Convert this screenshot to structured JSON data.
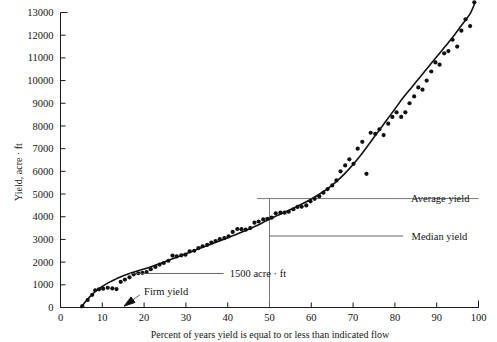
{
  "chart_data": {
    "type": "scatter",
    "title": "",
    "xlabel": "Percent of years yield is equal to or less than indicated flow",
    "ylabel": "Yield, acre · ft",
    "xlim": [
      0,
      100
    ],
    "ylim": [
      0,
      13000
    ],
    "grid": false,
    "legend": null,
    "xticks": [
      0,
      10,
      20,
      30,
      40,
      50,
      60,
      70,
      80,
      90,
      100
    ],
    "xtick_labels": [
      "0",
      "10",
      "20",
      "30",
      "40",
      "50",
      "60",
      "70",
      "80",
      "90",
      "100"
    ],
    "yticks": [
      0,
      1000,
      2000,
      3000,
      4000,
      5000,
      6000,
      7000,
      8000,
      9000,
      10000,
      11000,
      12000,
      13000
    ],
    "ytick_labels": [
      "0",
      "1000",
      "2000",
      "3000",
      "4000",
      "5000",
      "6000",
      "7000",
      "8000",
      "9000",
      "10000",
      "11000",
      "12000",
      "13000"
    ],
    "series": [
      {
        "name": "Observed yield",
        "marker": "dot",
        "points": [
          [
            5.2,
            60
          ],
          [
            6.5,
            330
          ],
          [
            7.6,
            560
          ],
          [
            8.3,
            760
          ],
          [
            9.2,
            800
          ],
          [
            10.2,
            830
          ],
          [
            11.3,
            870
          ],
          [
            12.4,
            840
          ],
          [
            13.4,
            810
          ],
          [
            14.4,
            1130
          ],
          [
            15.4,
            1230
          ],
          [
            16.5,
            1330
          ],
          [
            17.5,
            1460
          ],
          [
            18.6,
            1510
          ],
          [
            19.6,
            1530
          ],
          [
            20.6,
            1560
          ],
          [
            21.6,
            1690
          ],
          [
            22.7,
            1790
          ],
          [
            23.7,
            1890
          ],
          [
            24.7,
            1960
          ],
          [
            25.8,
            2060
          ],
          [
            26.8,
            2290
          ],
          [
            27.8,
            2250
          ],
          [
            28.9,
            2300
          ],
          [
            29.9,
            2330
          ],
          [
            30.9,
            2470
          ],
          [
            32.0,
            2500
          ],
          [
            33.0,
            2620
          ],
          [
            34.0,
            2700
          ],
          [
            35.1,
            2760
          ],
          [
            36.1,
            2860
          ],
          [
            37.1,
            2930
          ],
          [
            38.1,
            3010
          ],
          [
            39.2,
            3060
          ],
          [
            40.2,
            3130
          ],
          [
            41.2,
            3330
          ],
          [
            42.3,
            3460
          ],
          [
            43.3,
            3450
          ],
          [
            44.3,
            3430
          ],
          [
            45.4,
            3500
          ],
          [
            46.4,
            3740
          ],
          [
            47.4,
            3790
          ],
          [
            48.5,
            3880
          ],
          [
            49.5,
            3910
          ],
          [
            50.5,
            3960
          ],
          [
            51.5,
            4150
          ],
          [
            52.6,
            4180
          ],
          [
            53.6,
            4180
          ],
          [
            54.6,
            4220
          ],
          [
            55.7,
            4330
          ],
          [
            56.7,
            4430
          ],
          [
            57.7,
            4440
          ],
          [
            58.8,
            4500
          ],
          [
            59.8,
            4680
          ],
          [
            60.8,
            4790
          ],
          [
            61.9,
            4900
          ],
          [
            62.9,
            5060
          ],
          [
            63.9,
            5220
          ],
          [
            65.0,
            5380
          ],
          [
            66.0,
            5600
          ],
          [
            67.0,
            6000
          ],
          [
            68.1,
            6260
          ],
          [
            69.1,
            6530
          ],
          [
            70.1,
            6330
          ],
          [
            71.1,
            7000
          ],
          [
            72.2,
            7300
          ],
          [
            73.2,
            5890
          ],
          [
            74.2,
            7700
          ],
          [
            75.3,
            7650
          ],
          [
            76.3,
            7850
          ],
          [
            77.3,
            7600
          ],
          [
            78.4,
            8100
          ],
          [
            79.4,
            8400
          ],
          [
            80.4,
            8600
          ],
          [
            81.5,
            8400
          ],
          [
            82.5,
            8600
          ],
          [
            83.5,
            9000
          ],
          [
            84.6,
            9300
          ],
          [
            85.6,
            9700
          ],
          [
            86.6,
            9600
          ],
          [
            87.6,
            10000
          ],
          [
            88.7,
            10400
          ],
          [
            89.7,
            10800
          ],
          [
            90.7,
            10700
          ],
          [
            91.8,
            11200
          ],
          [
            92.8,
            11300
          ],
          [
            93.8,
            11800
          ],
          [
            94.9,
            11500
          ],
          [
            95.9,
            12200
          ],
          [
            96.9,
            12700
          ],
          [
            98.0,
            12400
          ],
          [
            99.0,
            13450
          ]
        ]
      }
    ],
    "fitted_curve": {
      "name": "Fitted yield duration curve",
      "points": [
        [
          5.0,
          0
        ],
        [
          6.0,
          260
        ],
        [
          7.0,
          470
        ],
        [
          8.0,
          650
        ],
        [
          9.0,
          800
        ],
        [
          10.0,
          930
        ],
        [
          11.0,
          1040
        ],
        [
          12.0,
          1140
        ],
        [
          13.0,
          1230
        ],
        [
          14.0,
          1320
        ],
        [
          15.0,
          1400
        ],
        [
          16.5,
          1500
        ],
        [
          18.0,
          1590
        ],
        [
          20.0,
          1700
        ],
        [
          22.0,
          1820
        ],
        [
          24.0,
          1950
        ],
        [
          26.0,
          2090
        ],
        [
          28.0,
          2230
        ],
        [
          30.0,
          2370
        ],
        [
          32.0,
          2510
        ],
        [
          34.0,
          2650
        ],
        [
          36.0,
          2790
        ],
        [
          38.0,
          2930
        ],
        [
          40.0,
          3070
        ],
        [
          42.0,
          3220
        ],
        [
          44.0,
          3370
        ],
        [
          46.0,
          3530
        ],
        [
          48.0,
          3700
        ],
        [
          50.0,
          3900
        ],
        [
          52.0,
          4060
        ],
        [
          54.0,
          4230
        ],
        [
          56.0,
          4400
        ],
        [
          58.0,
          4580
        ],
        [
          60.0,
          4780
        ],
        [
          62.0,
          5000
        ],
        [
          64.0,
          5250
        ],
        [
          66.0,
          5550
        ],
        [
          68.0,
          5900
        ],
        [
          70.0,
          6300
        ],
        [
          72.0,
          6750
        ],
        [
          74.0,
          7250
        ],
        [
          76.0,
          7750
        ],
        [
          78.0,
          8250
        ],
        [
          80.0,
          8750
        ],
        [
          82.0,
          9250
        ],
        [
          84.0,
          9700
        ],
        [
          86.0,
          10150
        ],
        [
          88.0,
          10600
        ],
        [
          90.0,
          11050
        ],
        [
          92.0,
          11500
        ],
        [
          94.0,
          11950
        ],
        [
          96.0,
          12450
        ],
        [
          98.0,
          12950
        ],
        [
          99.2,
          13450
        ]
      ]
    },
    "annotations": [
      {
        "id": "average-yield",
        "label": "Average yield",
        "type": "horizontal-line-with-leader",
        "value": 4800,
        "line_x_start": 47.0,
        "line_x_end": 100.0,
        "label_x": 104.0
      },
      {
        "id": "median-yield",
        "label": "Median yield",
        "type": "vertical-line-with-leader",
        "value": 50,
        "leader_y": 3150,
        "leader_x_end": 82.0,
        "label_x": 84.0
      },
      {
        "id": "firm-yield-1500",
        "label": "1500 acre · ft",
        "type": "leader-line",
        "value": 1500,
        "anchor_x": 16.5,
        "leader_x_end": 39.0,
        "label_x": 40.5
      },
      {
        "id": "firm-yield",
        "label": "Firm yield",
        "type": "arrow",
        "arrow_tip_x": 15.2,
        "arrow_tip_y": 60,
        "arrow_tail_x": 19.0,
        "arrow_tail_y": 560,
        "label_x": 20.0,
        "label_y": 700
      }
    ]
  }
}
